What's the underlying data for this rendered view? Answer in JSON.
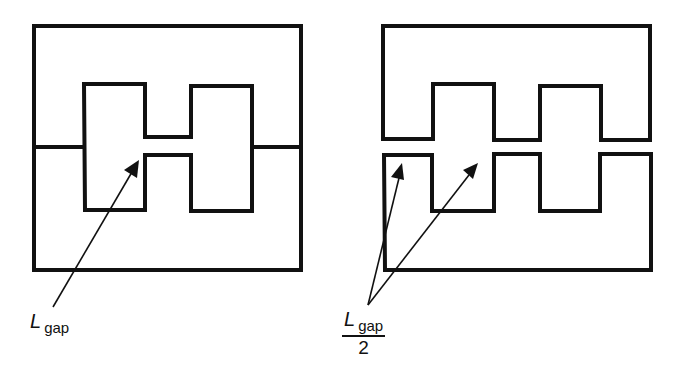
{
  "figure": {
    "stroke_color": "#111111",
    "background": "#ffffff"
  },
  "left_core": {
    "label": {
      "symbol": "L",
      "subscript": "gap"
    },
    "gap_type": "center-leg gap"
  },
  "right_core": {
    "label": {
      "symbol": "L",
      "subscript": "gap",
      "denominator": "2"
    },
    "gap_type": "gap across all legs"
  }
}
